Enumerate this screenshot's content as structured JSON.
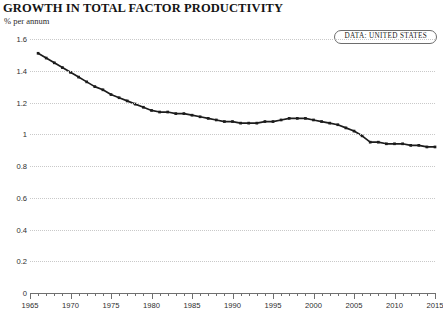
{
  "header": {
    "title": "GROWTH IN TOTAL FACTOR PRODUCTIVITY",
    "subtitle": "% per annum"
  },
  "legend": {
    "badge_label": "DATA: UNITED STATES"
  },
  "colors": {
    "line": "#1c1c1c",
    "grid": "#c9c9c9",
    "axis": "#6f6f6f",
    "text": "#1a1a1a",
    "background": "#ffffff"
  },
  "chart_data": {
    "type": "line",
    "title": "GROWTH IN TOTAL FACTOR PRODUCTIVITY",
    "subtitle": "% per annum",
    "xlabel": "",
    "ylabel": "% per annum",
    "xlim": [
      1965,
      2015
    ],
    "ylim": [
      0,
      1.6
    ],
    "grid": true,
    "legend_position": "top-right",
    "ytick_labels": [
      "0",
      "0.2",
      "0.4",
      "0.6",
      "0.8",
      "1",
      "1.2",
      "1.4",
      "1.6"
    ],
    "ytick_values": [
      0,
      0.2,
      0.4,
      0.6,
      0.8,
      1,
      1.2,
      1.4,
      1.6
    ],
    "xtick_labels": [
      "1965",
      "1970",
      "1975",
      "1980",
      "1985",
      "1990",
      "1995",
      "2000",
      "2005",
      "2010",
      "2015"
    ],
    "xtick_values": [
      1965,
      1970,
      1975,
      1980,
      1985,
      1990,
      1995,
      2000,
      2005,
      2010,
      2015
    ],
    "xtick_minor_step": 1,
    "marker": "square",
    "series": [
      {
        "name": "United States",
        "x": [
          1966,
          1967,
          1968,
          1969,
          1970,
          1971,
          1972,
          1973,
          1974,
          1975,
          1976,
          1977,
          1978,
          1979,
          1980,
          1981,
          1982,
          1983,
          1984,
          1985,
          1986,
          1987,
          1988,
          1989,
          1990,
          1991,
          1992,
          1993,
          1994,
          1995,
          1996,
          1997,
          1998,
          1999,
          2000,
          2001,
          2002,
          2003,
          2004,
          2005,
          2006,
          2007,
          2008,
          2009,
          2010,
          2011,
          2012,
          2013,
          2014,
          2015
        ],
        "values": [
          1.51,
          1.48,
          1.45,
          1.42,
          1.39,
          1.36,
          1.33,
          1.3,
          1.28,
          1.25,
          1.23,
          1.21,
          1.19,
          1.17,
          1.15,
          1.14,
          1.14,
          1.13,
          1.13,
          1.12,
          1.11,
          1.1,
          1.09,
          1.08,
          1.08,
          1.07,
          1.07,
          1.07,
          1.08,
          1.08,
          1.09,
          1.1,
          1.1,
          1.1,
          1.09,
          1.08,
          1.07,
          1.06,
          1.04,
          1.02,
          0.99,
          0.95,
          0.95,
          0.94,
          0.94,
          0.94,
          0.93,
          0.93,
          0.92,
          0.92
        ]
      }
    ]
  }
}
